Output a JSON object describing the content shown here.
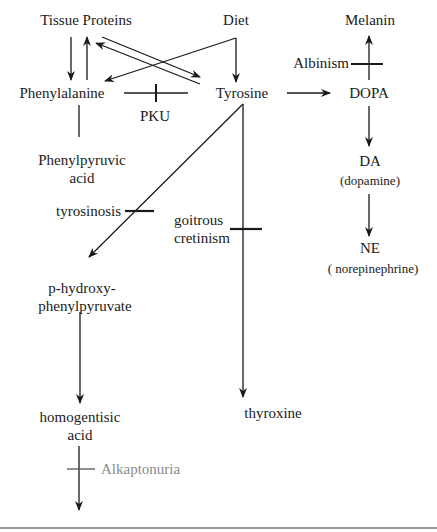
{
  "diagram": {
    "type": "metabolic-pathway",
    "nodes": {
      "tissue_proteins": "Tissue Proteins",
      "diet": "Diet",
      "melanin": "Melanin",
      "phenylalanine": "Phenylalanine",
      "tyrosine": "Tyrosine",
      "dopa": "DOPA",
      "phenylpyruvic_acid_line1": "Phenylpyruvic",
      "phenylpyruvic_acid_line2": "acid",
      "da": "DA",
      "da_full": "(dopamine)",
      "ne": "NE",
      "ne_full": "( norepinephrine)",
      "p_hydroxy_line1": "p-hydroxy-",
      "p_hydroxy_line2": "phenylpyruvate",
      "homogentisic_line1": "homogentisic",
      "homogentisic_line2": "acid",
      "thyroxine": "thyroxine"
    },
    "blocks": {
      "pku": "PKU",
      "albinism": "Albinism",
      "tyrosinosis": "tyrosinosis",
      "goitrous_line1": "goitrous",
      "goitrous_line2": "cretinism",
      "alkaptonuria": "Alkaptonuria"
    },
    "edges": [
      {
        "from": "Tissue Proteins",
        "to": "Phenylalanine",
        "type": "arrow"
      },
      {
        "from": "Phenylalanine",
        "to": "Tissue Proteins",
        "type": "arrow"
      },
      {
        "from": "Tissue Proteins",
        "to": "Tyrosine",
        "type": "arrow"
      },
      {
        "from": "Tyrosine",
        "to": "Tissue Proteins",
        "type": "arrow"
      },
      {
        "from": "Diet",
        "to": "Phenylalanine",
        "type": "arrow"
      },
      {
        "from": "Diet",
        "to": "Tyrosine",
        "type": "arrow"
      },
      {
        "from": "Phenylalanine",
        "to": "Tyrosine",
        "type": "blocked",
        "block": "PKU"
      },
      {
        "from": "Phenylalanine",
        "to": "Phenylpyruvic acid",
        "type": "line"
      },
      {
        "from": "Tyrosine",
        "to": "DOPA",
        "type": "arrow"
      },
      {
        "from": "DOPA",
        "to": "Melanin",
        "type": "arrow",
        "block": "Albinism"
      },
      {
        "from": "DOPA",
        "to": "DA",
        "type": "arrow"
      },
      {
        "from": "DA",
        "to": "NE",
        "type": "arrow"
      },
      {
        "from": "Tyrosine",
        "to": "p-hydroxyphenylpyruvate",
        "type": "arrow",
        "block": "tyrosinosis"
      },
      {
        "from": "Tyrosine",
        "to": "thyroxine",
        "type": "arrow",
        "block": "goitrous cretinism"
      },
      {
        "from": "p-hydroxyphenylpyruvate",
        "to": "homogentisic acid",
        "type": "arrow"
      },
      {
        "from": "homogentisic acid",
        "to": "(downstream)",
        "type": "arrow",
        "block": "Alkaptonuria"
      }
    ],
    "colors": {
      "ink": "#1a1a1a",
      "alkaptonuria_label": "#8a8a8a",
      "rule": "#9a9a9a"
    }
  }
}
